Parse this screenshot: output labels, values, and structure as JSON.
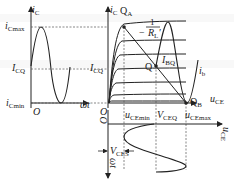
{
  "figure": {
    "type": "transistor amplifier graphical analysis",
    "colors": {
      "line": "#222222",
      "dashed": "#555555",
      "background": "#ffffff"
    }
  },
  "left_panel": {
    "y_axis_label": {
      "main": "i",
      "sub": "C"
    },
    "x_axis_label": "ωt",
    "origin_label": "O",
    "levels": [
      {
        "main": "i",
        "sub": "Cmax"
      },
      {
        "main": "I",
        "sub": "CQ"
      },
      {
        "main": "i",
        "sub": "Cmin"
      }
    ]
  },
  "right_panel": {
    "y_axis_label": {
      "main": "i",
      "sub": "C"
    },
    "x_axis_label": {
      "main": "u",
      "sub": "CE"
    },
    "origin_label": "O",
    "icq_label": {
      "main": "I",
      "sub": "CQ"
    },
    "points": {
      "qa": {
        "main": "Q",
        "sub": "A"
      },
      "q": "Q",
      "qb": {
        "main": "Q",
        "sub": "B"
      }
    },
    "slope_label": {
      "numerator": "1",
      "prefix": "−",
      "denominator": "R",
      "denominator_sub": "L",
      "denominator_prime": "′"
    },
    "ibq_label": {
      "main": "I",
      "sub": "BQ"
    },
    "ib_label": {
      "main": "i",
      "sub": "b"
    },
    "x_levels": [
      {
        "main": "u",
        "sub": "CEmin"
      },
      {
        "main": "V",
        "sub": "CEQ"
      },
      {
        "main": "u",
        "sub": "CEmax"
      }
    ]
  },
  "bottom_panel": {
    "origin_label": "O",
    "x_axis_label": {
      "main": "u",
      "sub": "CE"
    },
    "time_axis_label": "ωt",
    "ces_label": {
      "main": "V",
      "sub": "CES"
    }
  }
}
